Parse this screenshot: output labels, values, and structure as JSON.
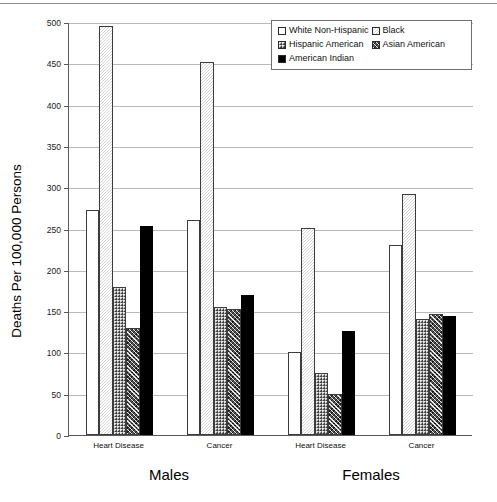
{
  "chart_data": {
    "type": "bar",
    "title": "",
    "xlabel": "",
    "ylabel": "Deaths Per 100,000 Persons",
    "ylim": [
      0,
      500
    ],
    "ytick_step": 50,
    "yticks": [
      "500",
      "450",
      "400",
      "350",
      "300",
      "250",
      "200",
      "150",
      "100",
      "50",
      "0"
    ],
    "grid": true,
    "legend_position": "top-right",
    "legend_entries": [
      {
        "name": "White Non-Hispanic",
        "pattern": "solid-white"
      },
      {
        "name": "Black",
        "pattern": "light-dotted"
      },
      {
        "name": "Hispanic American",
        "pattern": "dense-dotted"
      },
      {
        "name": "Asian American",
        "pattern": "diagonal-crosshatch"
      },
      {
        "name": "American Indian",
        "pattern": "solid-black"
      }
    ],
    "supergroups": [
      {
        "label": "Males",
        "categories": [
          "Heart Disease",
          "Cancer"
        ]
      },
      {
        "label": "Females",
        "categories": [
          "Heart Disease",
          "Cancer"
        ]
      }
    ],
    "categories": [
      "Heart Disease",
      "Cancer",
      "Heart Disease",
      "Cancer"
    ],
    "series": [
      {
        "name": "White Non-Hispanic",
        "values": [
          272,
          260,
          100,
          230
        ]
      },
      {
        "name": "Black",
        "values": [
          495,
          452,
          251,
          292
        ]
      },
      {
        "name": "Hispanic American",
        "values": [
          179,
          155,
          75,
          141
        ]
      },
      {
        "name": "Asian American",
        "values": [
          130,
          152,
          50,
          147
        ]
      },
      {
        "name": "American Indian",
        "values": [
          253,
          170,
          126,
          144
        ]
      }
    ]
  }
}
